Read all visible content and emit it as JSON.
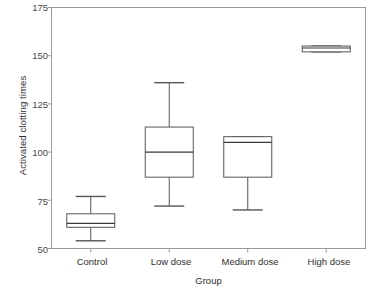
{
  "chart_data": {
    "type": "box",
    "title": "",
    "xlabel": "Group",
    "ylabel": "Activated clotting times",
    "categories": [
      "Control",
      "Low dose",
      "Medium dose",
      "High dose"
    ],
    "ylim": [
      50,
      175
    ],
    "yticks": [
      50,
      75,
      100,
      125,
      150,
      175
    ],
    "ytick_labels": [
      "50",
      "75",
      "100",
      "125",
      "150",
      "175"
    ],
    "grid": false,
    "legend": "none",
    "boxes": [
      {
        "category": "Control",
        "whisker_low": 54,
        "q1": 61,
        "median": 63,
        "q3": 68,
        "whisker_high": 77,
        "outliers": []
      },
      {
        "category": "Low dose",
        "whisker_low": 72,
        "q1": 87,
        "median": 100,
        "q3": 113,
        "whisker_high": 136,
        "outliers": []
      },
      {
        "category": "Medium dose",
        "whisker_low": 70,
        "q1": 87,
        "median": 105,
        "q3": 108,
        "whisker_high": 108,
        "outliers": []
      },
      {
        "category": "High dose",
        "whisker_low": 152,
        "q1": 152,
        "median": 154,
        "q3": 155,
        "whisker_high": 155,
        "outliers": []
      }
    ],
    "colors": {
      "box_stroke": "#555555",
      "median_stroke": "#3a3a3a",
      "whisker_stroke": "#555555",
      "frame_stroke": "#9a9a9a",
      "background": "#ffffff"
    }
  },
  "axes": {
    "y_title": "Activated clotting times",
    "x_title": "Group",
    "y_ticks": [
      {
        "label": "175"
      },
      {
        "label": "150"
      },
      {
        "label": "125"
      },
      {
        "label": "100"
      },
      {
        "label": "75"
      },
      {
        "label": "50"
      }
    ],
    "x_ticks": [
      {
        "label": "Control"
      },
      {
        "label": "Low dose"
      },
      {
        "label": "Medium dose"
      },
      {
        "label": "High dose"
      }
    ]
  }
}
